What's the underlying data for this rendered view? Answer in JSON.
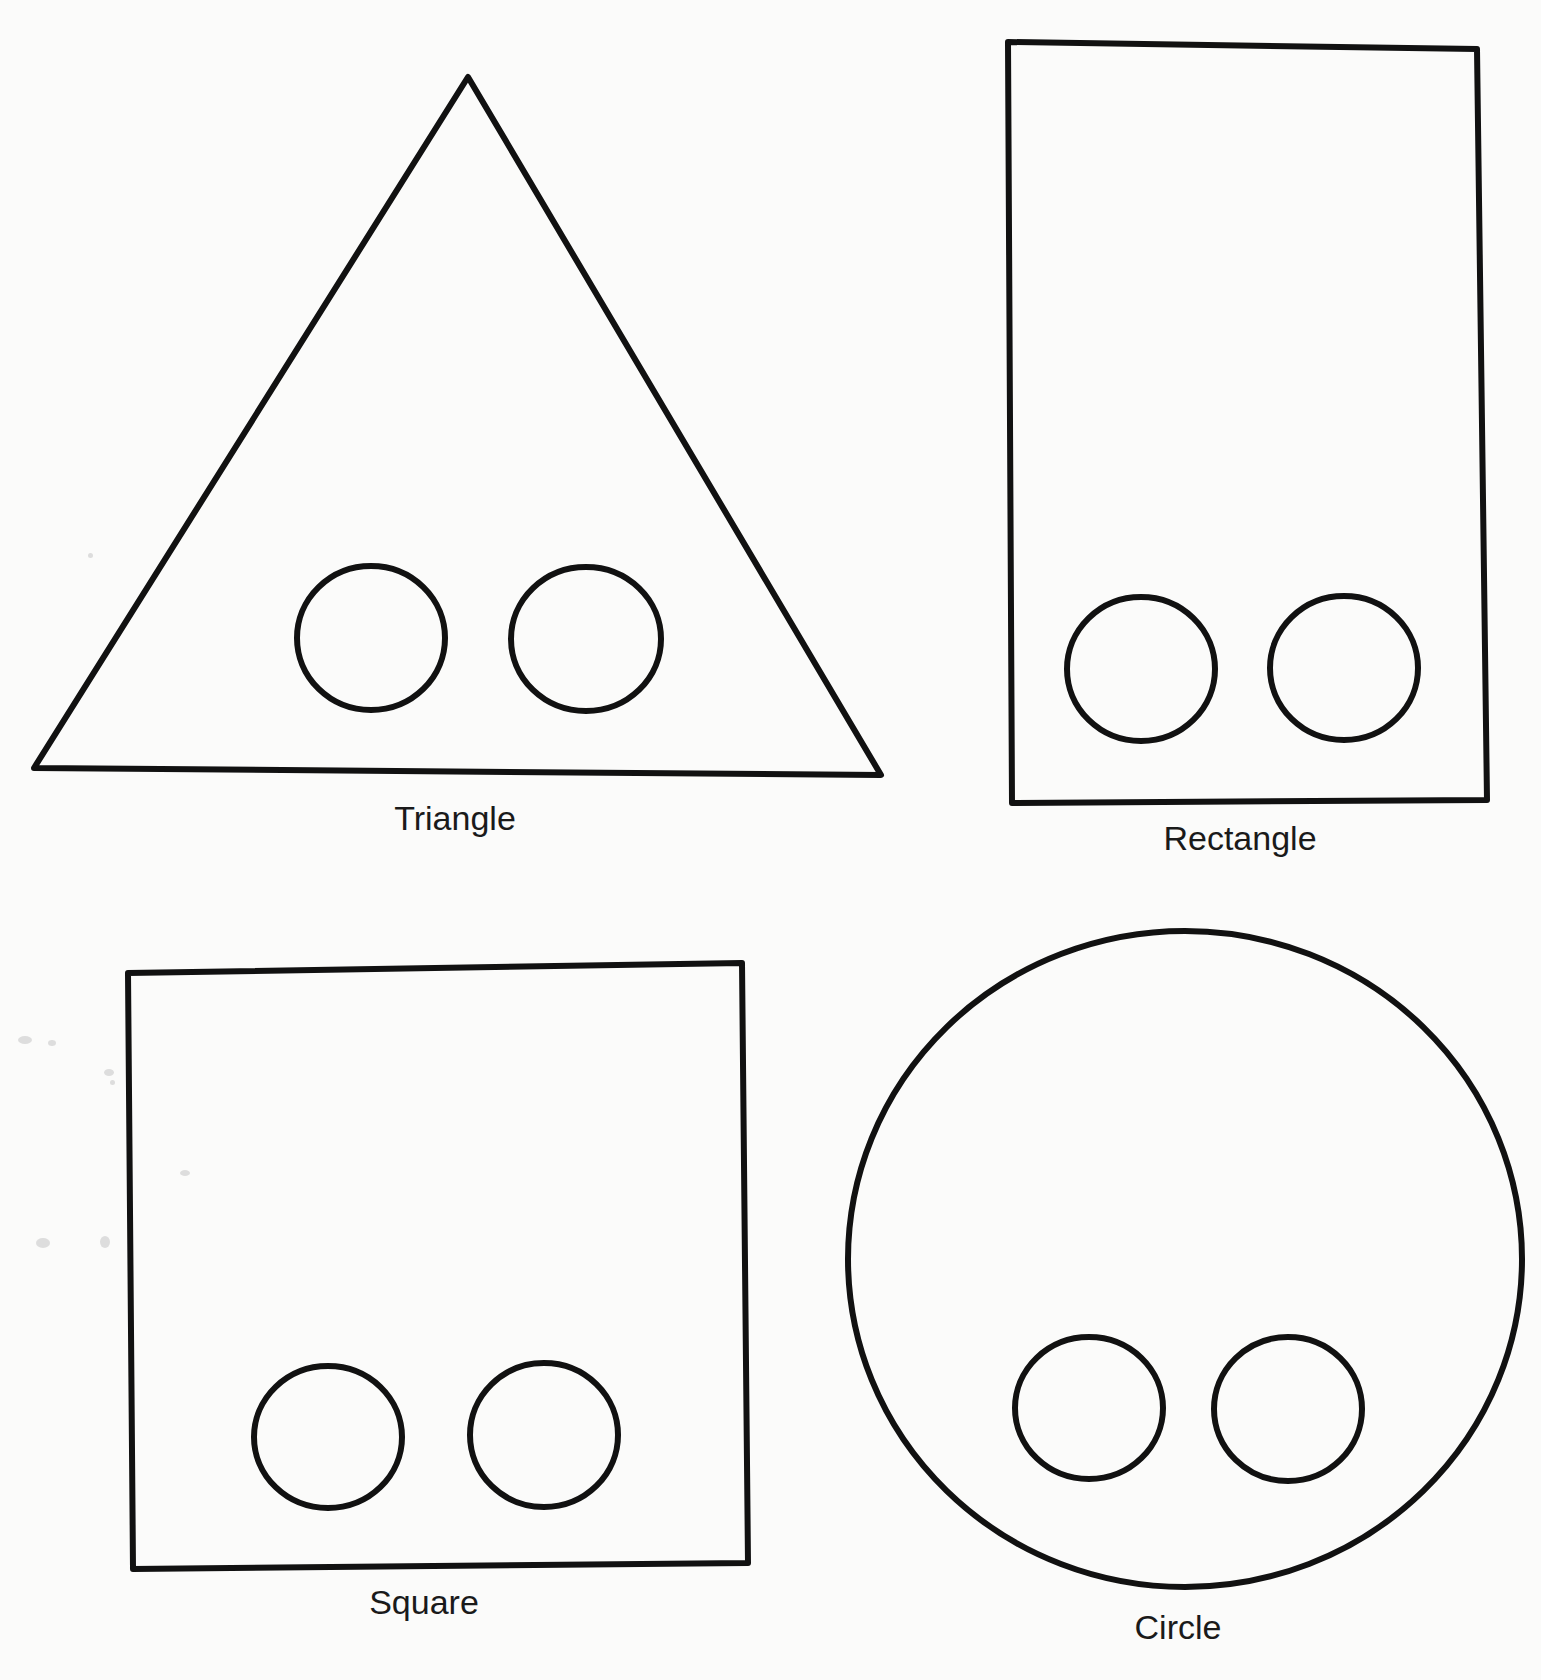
{
  "page": {
    "background": "#fbfbfa",
    "stroke_color": "#111111"
  },
  "shapes": [
    {
      "id": "triangle",
      "label": "Triangle",
      "kind": "polygon",
      "points": "468,77 881,775 34,768",
      "label_pos": {
        "x": 455,
        "y": 801
      },
      "holes": [
        {
          "cx": 371,
          "cy": 638,
          "rx": 74,
          "ry": 72
        },
        {
          "cx": 586,
          "cy": 639,
          "rx": 75,
          "ry": 72
        }
      ]
    },
    {
      "id": "rectangle",
      "label": "Rectangle",
      "kind": "polygon",
      "points": "1008,42 1477,49 1487,800 1012,803",
      "label_pos": {
        "x": 1240,
        "y": 821
      },
      "holes": [
        {
          "cx": 1141,
          "cy": 669,
          "rx": 74,
          "ry": 72
        },
        {
          "cx": 1344,
          "cy": 668,
          "rx": 74,
          "ry": 72
        }
      ]
    },
    {
      "id": "square",
      "label": "Square",
      "kind": "polygon",
      "points": "128,973 742,963 748,1563 133,1569",
      "label_pos": {
        "x": 424,
        "y": 1585
      },
      "holes": [
        {
          "cx": 328,
          "cy": 1437,
          "rx": 74,
          "ry": 71
        },
        {
          "cx": 544,
          "cy": 1435,
          "rx": 74,
          "ry": 72
        }
      ]
    },
    {
      "id": "circle",
      "label": "Circle",
      "kind": "ellipse",
      "ellipse": {
        "cx": 1185,
        "cy": 1259,
        "rx": 337,
        "ry": 328
      },
      "label_pos": {
        "x": 1178,
        "y": 1610
      },
      "holes": [
        {
          "cx": 1089,
          "cy": 1408,
          "rx": 74,
          "ry": 71
        },
        {
          "cx": 1288,
          "cy": 1409,
          "rx": 74,
          "ry": 72
        }
      ]
    }
  ]
}
